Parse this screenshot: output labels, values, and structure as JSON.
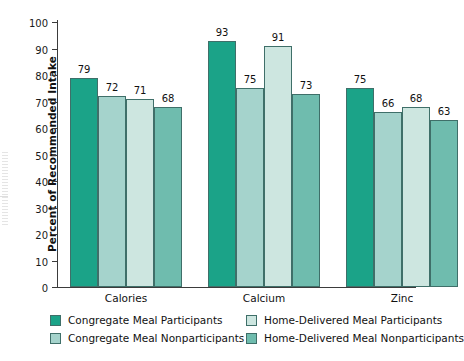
{
  "chart_data": {
    "type": "bar",
    "title": "",
    "subtitle": "",
    "xlabel": "",
    "ylabel": "Percent of Recommended Intake",
    "ylim": [
      0,
      100
    ],
    "yticks": [
      0,
      10,
      20,
      30,
      40,
      50,
      60,
      70,
      80,
      90,
      100
    ],
    "ytick_labels": [
      "0",
      "10",
      "20",
      "30",
      "40",
      "50",
      "60",
      "70",
      "80",
      "90",
      "100"
    ],
    "grid": false,
    "legend_position": "bottom",
    "categories": [
      "Calories",
      "Calcium",
      "Zinc"
    ],
    "series": [
      {
        "name": "Congregate Meal Participants",
        "color": "#1ba388",
        "values": [
          79,
          93,
          75
        ]
      },
      {
        "name": "Congregate Meal Nonparticipants",
        "color": "#a5d3cc",
        "values": [
          72,
          75,
          66
        ]
      },
      {
        "name": "Home-Delivered Meal Participants",
        "color": "#cde6e0",
        "values": [
          71,
          91,
          68
        ]
      },
      {
        "name": "Home-Delivered Meal Nonparticipants",
        "color": "#6fbcae",
        "values": [
          68,
          73,
          63
        ]
      }
    ],
    "data_labels": [
      [
        "79",
        "72",
        "71",
        "68"
      ],
      [
        "93",
        "75",
        "91",
        "73"
      ],
      [
        "75",
        "66",
        "68",
        "63"
      ]
    ],
    "colors": {
      "axis": "#3b3b3b",
      "bar_outline": "#3f6f69",
      "text": "#111111",
      "background": "#ffffff"
    }
  }
}
